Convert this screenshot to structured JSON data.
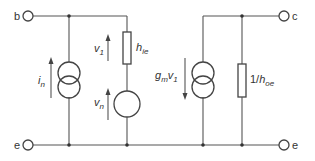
{
  "diagram": {
    "type": "transistor small-signal noise equivalent circuit",
    "terminals": {
      "base": "b",
      "collector": "c",
      "emitter_left": "e",
      "emitter_right": "e"
    },
    "components": {
      "noise_current_source": {
        "symbol": "i",
        "subscript": "n"
      },
      "input_voltage": {
        "symbol": "v",
        "subscript": "1"
      },
      "input_resistance": {
        "symbol": "h",
        "subscript": "ie"
      },
      "noise_voltage_source": {
        "symbol": "v",
        "subscript": "n"
      },
      "dependent_current_source": {
        "prefix": "g",
        "prefix_subscript": "m",
        "symbol": "v",
        "subscript": "1"
      },
      "output_resistance": {
        "prefix": "1/",
        "symbol": "h",
        "subscript": "oe"
      }
    },
    "colors": {
      "line": "#444444",
      "text": "#333333",
      "background": "#ffffff"
    }
  }
}
